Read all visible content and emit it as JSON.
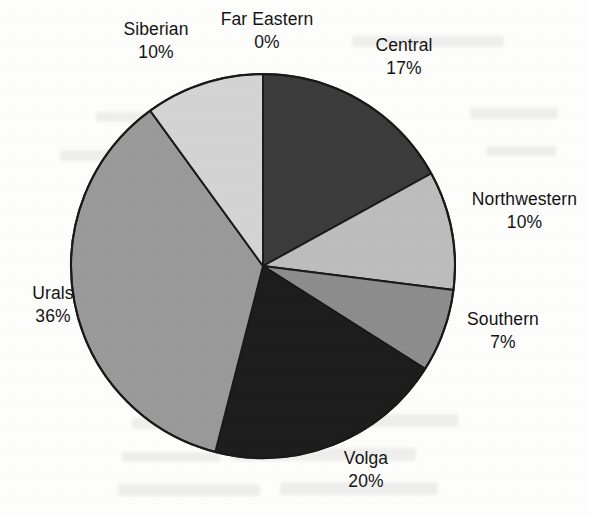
{
  "chart_data": {
    "type": "pie",
    "title": "",
    "subtitle": "",
    "xlabel": "",
    "ylabel": "",
    "legend_position": "none",
    "grid": false,
    "value_unit": "%",
    "value_total": 100,
    "categories": [
      "Central",
      "Northwestern",
      "Southern",
      "Volga",
      "Urals",
      "Siberian",
      "Far Eastern"
    ],
    "values": [
      17,
      10,
      7,
      20,
      36,
      10,
      0
    ],
    "slices": [
      {
        "label": "Central",
        "value": 17,
        "value_text": "17%",
        "color": "#3c3c3c",
        "start_angle": 0,
        "end_angle": 61.2
      },
      {
        "label": "Northwestern",
        "value": 10,
        "value_text": "10%",
        "color": "#bdbdbd",
        "start_angle": 61.2,
        "end_angle": 97.2
      },
      {
        "label": "Southern",
        "value": 7,
        "value_text": "7%",
        "color": "#8d8d8d",
        "start_angle": 97.2,
        "end_angle": 122.4
      },
      {
        "label": "Volga",
        "value": 20,
        "value_text": "20%",
        "color": "#1e1e1e",
        "start_angle": 122.4,
        "end_angle": 194.4
      },
      {
        "label": "Urals",
        "value": 36,
        "value_text": "36%",
        "color": "#9a9a9a",
        "start_angle": 194.4,
        "end_angle": 324.0
      },
      {
        "label": "Siberian",
        "value": 10,
        "value_text": "10%",
        "color": "#d4d4d4",
        "start_angle": 324.0,
        "end_angle": 360.0
      },
      {
        "label": "Far Eastern",
        "value": 0,
        "value_text": "0%",
        "color": "#ffffff",
        "start_angle": 360.0,
        "end_angle": 360.0
      }
    ],
    "outline_color": "#1a1a1a",
    "background_color": "#fdfdfc"
  },
  "labels": {
    "siberian": {
      "name": "Siberian",
      "value": "10%"
    },
    "far_eastern": {
      "name": "Far Eastern",
      "value": "0%"
    },
    "central": {
      "name": "Central",
      "value": "17%"
    },
    "northwestern": {
      "name": "Northwestern",
      "value": "10%"
    },
    "southern": {
      "name": "Southern",
      "value": "7%"
    },
    "volga": {
      "name": "Volga",
      "value": "20%"
    },
    "urals": {
      "name": "Urals",
      "value": "36%"
    }
  }
}
